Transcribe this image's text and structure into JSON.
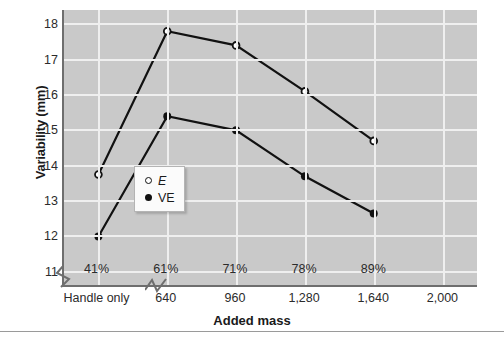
{
  "chart_data": {
    "type": "line",
    "title": "",
    "xlabel": "Added mass",
    "ylabel": "Variability (mm)",
    "ylim": [
      10.6,
      18.4
    ],
    "yticks": [
      11,
      12,
      13,
      14,
      15,
      16,
      17,
      18
    ],
    "grid": true,
    "legend_position": "inner-center-left",
    "categories": [
      "Handle only",
      "640",
      "960",
      "1,280",
      "1,640"
    ],
    "category_secondary_labels": [
      "41%",
      "61%",
      "71%",
      "78%",
      "89%"
    ],
    "xtick_labels": [
      "Handle only",
      "640",
      "960",
      "1,280",
      "1,640",
      "2,000"
    ],
    "axis_breaks": [
      "y-axis-break-below-11",
      "x-axis-break-after-handle-only"
    ],
    "series": [
      {
        "name": "E",
        "marker": "open-circle",
        "values": [
          13.75,
          17.8,
          17.4,
          16.1,
          14.7
        ]
      },
      {
        "name": "VE",
        "marker": "filled-circle",
        "values": [
          12.0,
          15.4,
          15.0,
          13.7,
          12.65
        ]
      }
    ],
    "colors": {
      "plot_background": "#c9c9c9",
      "gridline": "#efefef",
      "axis": "#6e6e6e",
      "line": "#111111",
      "text": "#1a1a1a"
    }
  },
  "legend": {
    "entries": [
      {
        "label": "E",
        "marker": "open-circle"
      },
      {
        "label": "VE",
        "marker": "filled-circle"
      }
    ]
  },
  "axis": {
    "y_title": "Variability (mm)",
    "x_title": "Added mass"
  }
}
